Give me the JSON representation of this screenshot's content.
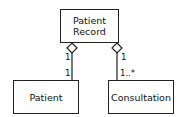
{
  "classes": {
    "record": {
      "line1": "Patient",
      "line2": "Record"
    },
    "patient": {
      "name": "Patient"
    },
    "consultation": {
      "name": "Consultation"
    }
  },
  "associations": [
    {
      "from": "Patient Record",
      "to": "Patient",
      "type": "aggregation",
      "source_multiplicity": "1",
      "target_multiplicity": "1"
    },
    {
      "from": "Patient Record",
      "to": "Consultation",
      "type": "aggregation",
      "source_multiplicity": "1",
      "target_multiplicity": "1..*"
    }
  ]
}
